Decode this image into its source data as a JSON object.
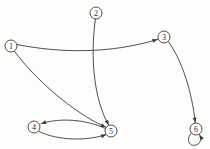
{
  "diagram": {
    "type": "directed-graph",
    "background_color": "#fdfdfc",
    "stroke_color": "#3a3a3a",
    "node_fill_color": "#ffffff",
    "node_radius": 6,
    "width": 210,
    "height": 149,
    "nodes": [
      {
        "id": "1",
        "label": "1",
        "x": 11,
        "y": 46
      },
      {
        "id": "2",
        "label": "2",
        "x": 96,
        "y": 13
      },
      {
        "id": "3",
        "label": "3",
        "x": 164,
        "y": 37
      },
      {
        "id": "4",
        "label": "4",
        "x": 34,
        "y": 127
      },
      {
        "id": "5",
        "label": "5",
        "x": 111,
        "y": 131
      },
      {
        "id": "6",
        "label": "6",
        "x": 196,
        "y": 129
      }
    ],
    "edges": [
      {
        "id": "e1",
        "from": "1",
        "to": "3",
        "directed": true,
        "path": "M 17.3,44.6 C 60,53 110,54 157.6,39.4",
        "arrow_x": 157.6,
        "arrow_y": 39.4,
        "arrow_angle": -17
      },
      {
        "id": "e2",
        "from": "1",
        "to": "5",
        "directed": true,
        "path": "M 14.6,51.4 C 34,78 72,112 105.8,127.3",
        "arrow_x": 105.8,
        "arrow_y": 127.3,
        "arrow_angle": 27
      },
      {
        "id": "e3",
        "from": "2",
        "to": "5",
        "directed": true,
        "path": "M 95.4,19.0 C 90,58 94,100 108.8,125.3",
        "arrow_x": 108.8,
        "arrow_y": 125.3,
        "arrow_angle": 63
      },
      {
        "id": "e4",
        "from": "3",
        "to": "6",
        "directed": true,
        "path": "M 168.3,41.6 C 182,60 192,92 195.3,122.8",
        "arrow_x": 195.3,
        "arrow_y": 122.8,
        "arrow_angle": 82
      },
      {
        "id": "e5",
        "from": "5",
        "to": "4",
        "directed": true,
        "path": "M 105.2,128.5 C 88,120 60,117 41.0,123.8",
        "arrow_x": 41.0,
        "arrow_y": 123.8,
        "arrow_angle": 160
      },
      {
        "id": "e6",
        "from": "4",
        "to": "5",
        "directed": true,
        "path": "M 39.0,131.4 C 58,141 88,141 106.2,134.5",
        "arrow_x": 106.2,
        "arrow_y": 134.5,
        "arrow_angle": -22
      },
      {
        "id": "e7",
        "from": "6",
        "to": "6",
        "directed": true,
        "self_loop": true,
        "path": "M 191.5,132.8 C 185,140 190,147 196,145 C 201,143.5 201.5,138.5 199.5,134.8",
        "arrow_x": 199.5,
        "arrow_y": 134.8,
        "arrow_angle": -120
      }
    ]
  }
}
